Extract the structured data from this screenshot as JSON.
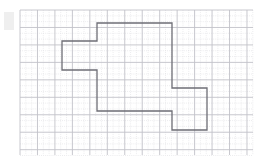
{
  "figure": {
    "background_color": "#ffffff",
    "canvas": {
      "width": 270,
      "height": 167
    }
  },
  "grid": {
    "area": {
      "x": 20,
      "y": 10,
      "width": 233,
      "height": 145
    },
    "minor_cell_px": 5.82,
    "major_every_n_cells": 3,
    "minor_color": "#d8d8dc",
    "major_color": "#c2c2c8",
    "minor_width": 0.5,
    "major_width": 0.9,
    "minor_dash": "1,1.1",
    "cols_minor": 40,
    "rows_minor": 25
  },
  "polygon": {
    "name": "orthogonal-staircase-polygon",
    "stroke_color": "#6e6e76",
    "stroke_width": 1.3,
    "fill": "none",
    "closed": true,
    "vertices": [
      [
        97,
        23
      ],
      [
        172,
        23
      ],
      [
        172,
        88
      ],
      [
        207,
        88
      ],
      [
        207,
        130
      ],
      [
        172,
        130
      ],
      [
        172,
        111
      ],
      [
        97,
        111
      ],
      [
        97,
        70
      ],
      [
        62,
        70
      ],
      [
        62,
        41
      ],
      [
        97,
        41
      ]
    ],
    "vertex_count": 12,
    "path_d": "M 97 23 L 172 23 L 172 88 L 207 88 L 207 130 L 172 130 L 172 111 L 97 111 L 97 70 L 62 70 L 62 41 L 97 41 Z"
  },
  "artifacts": {
    "corner_smudge": {
      "x": 4,
      "y": 12,
      "width": 10,
      "height": 18,
      "color": "#efefef"
    }
  }
}
